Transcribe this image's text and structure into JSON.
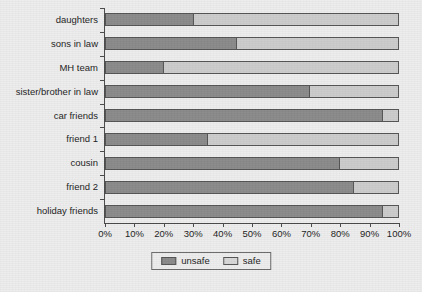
{
  "chart_data": {
    "type": "bar",
    "orientation": "horizontal",
    "stacked": true,
    "normalized": "100%",
    "title": "",
    "subtitle": "",
    "xlabel": "",
    "ylabel": "",
    "xlim": [
      0,
      100
    ],
    "grid": false,
    "legend_position": "bottom-center",
    "categories": [
      "daughters",
      "sons in law",
      "MH team",
      "sister/brother in law",
      "car friends",
      "friend 1",
      "cousin",
      "friend 2",
      "holiday friends"
    ],
    "xticks": [
      "0%",
      "10%",
      "20%",
      "30%",
      "40%",
      "50%",
      "60%",
      "70%",
      "80%",
      "90%",
      "100%"
    ],
    "xtick_values": [
      0,
      10,
      20,
      30,
      40,
      50,
      60,
      70,
      80,
      90,
      100
    ],
    "series": [
      {
        "name": "unsafe",
        "color": "#8a8a8a",
        "values": [
          30,
          45,
          20,
          70,
          95,
          35,
          80,
          85,
          95
        ]
      },
      {
        "name": "safe",
        "color": "#cccccc",
        "values": [
          70,
          55,
          80,
          30,
          5,
          65,
          20,
          15,
          5
        ]
      }
    ]
  },
  "legend": {
    "items": [
      {
        "label": "unsafe",
        "swatch": "unsafe"
      },
      {
        "label": "safe",
        "swatch": "safe"
      }
    ]
  },
  "colors": {
    "background": "#ededed",
    "unsafe": "#8a8a8a",
    "safe": "#cccccc",
    "axis": "#4a4a4a",
    "text": "#1c1c1c"
  }
}
